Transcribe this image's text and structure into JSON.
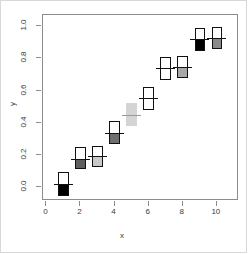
{
  "chart_data": {
    "type": "boxplot",
    "title": "",
    "subtitle": "",
    "xlabel": "x",
    "ylabel": "y",
    "xlim": [
      -0.2,
      11.3
    ],
    "ylim": [
      -0.085,
      1.07
    ],
    "xticks": [
      0,
      2,
      4,
      6,
      8,
      10
    ],
    "xticklabels": [
      "0",
      "2",
      "4",
      "6",
      "8",
      "10"
    ],
    "yticks": [
      0.0,
      0.2,
      0.4,
      0.6,
      0.8,
      1.0
    ],
    "yticklabels": [
      "0.0",
      "0.2",
      "0.4",
      "0.6",
      "0.8",
      "1.0"
    ],
    "grid": false,
    "legend": null,
    "box_width": 0.62,
    "median_overhang": 0.24,
    "boxes": [
      {
        "x": 1,
        "lower": -0.055,
        "median": 0.018,
        "upper": 0.092,
        "fill": "#000000",
        "upper_fill": "#ffffff",
        "border": "#111111"
      },
      {
        "x": 2,
        "lower": 0.112,
        "median": 0.178,
        "upper": 0.248,
        "fill": "#5f5f5f",
        "upper_fill": "#ffffff",
        "border": "#111111"
      },
      {
        "x": 3,
        "lower": 0.128,
        "median": 0.192,
        "upper": 0.258,
        "fill": "#c9c9c9",
        "upper_fill": "#ffffff",
        "border": "#111111"
      },
      {
        "x": 4,
        "lower": 0.268,
        "median": 0.338,
        "upper": 0.412,
        "fill": "#6e6e6e",
        "upper_fill": "#ffffff",
        "border": "#111111"
      },
      {
        "x": 5,
        "lower": 0.378,
        "median": 0.452,
        "upper": 0.522,
        "fill": "#d4d4d4",
        "upper_fill": "#d4d4d4",
        "border": "#d4d4d4"
      },
      {
        "x": 6,
        "lower": 0.478,
        "median": 0.552,
        "upper": 0.622,
        "fill": "#ffffff",
        "upper_fill": "#ffffff",
        "border": "#111111"
      },
      {
        "x": 7,
        "lower": 0.668,
        "median": 0.742,
        "upper": 0.812,
        "fill": "#ffffff",
        "upper_fill": "#ffffff",
        "border": "#111111"
      },
      {
        "x": 8,
        "lower": 0.678,
        "median": 0.748,
        "upper": 0.818,
        "fill": "#a8a8a8",
        "upper_fill": "#ffffff",
        "border": "#111111"
      },
      {
        "x": 9,
        "lower": 0.848,
        "median": 0.918,
        "upper": 0.988,
        "fill": "#000000",
        "upper_fill": "#ffffff",
        "border": "#111111"
      },
      {
        "x": 10,
        "lower": 0.858,
        "median": 0.925,
        "upper": 0.998,
        "fill": "#8a8a8a",
        "upper_fill": "#ffffff",
        "border": "#111111"
      }
    ]
  },
  "axes": {
    "x_title": "x",
    "y_title": "y"
  }
}
